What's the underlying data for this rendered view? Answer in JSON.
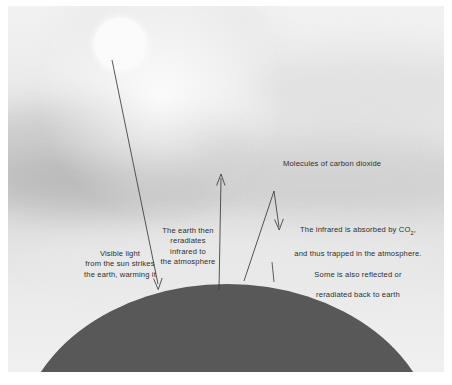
{
  "diagram": {
    "canvas": {
      "width": 452,
      "height": 385
    },
    "colors": {
      "earth": "#585858",
      "sun": "#fbfbfb",
      "sky_top": "#f2f2f2",
      "sky_mid": "#dedede",
      "ink": "#2e2e2e"
    },
    "elements": {
      "sun_name": "sun",
      "earth_name": "earth"
    },
    "labels": {
      "visible_light": "Visible light\nfrom the sun strikes\nthe earth, warming it",
      "reradiates": "The earth then\nreradiates\ninfrared to\nthe atmosphere",
      "absorbed_line1": "The infrared is absorbed by CO",
      "absorbed_sub": "2",
      "absorbed_line1_end": ",",
      "absorbed_line2": "and thus trapped in the atmosphere.",
      "absorbed_line3": "Some is also reflected or",
      "absorbed_line4": "reradiated back to earth",
      "molecules": "Molecules of carbon dioxide"
    },
    "arrows": [
      {
        "name": "incoming-sunlight-arrow",
        "description": "straight line from sun down to earth surface, arrowhead at earth",
        "points": [
          [
            112,
            60
          ],
          [
            158,
            289
          ]
        ],
        "head": "end-down"
      },
      {
        "name": "outgoing-infrared-arrow",
        "description": "vertical line from earth surface up into atmosphere, arrowhead at top",
        "points": [
          [
            219,
            290
          ],
          [
            221,
            174
          ]
        ],
        "head": "end-up"
      },
      {
        "name": "trapped-infrared-zigzag-arrow",
        "description": "line up from earth to a peak, then back down toward earth with arrowhead",
        "points": [
          [
            244,
            281
          ],
          [
            274,
            191
          ],
          [
            279,
            227
          ]
        ],
        "head": "end-down"
      },
      {
        "name": "co2-pointer-line-left",
        "description": "thin leader line from carbon dioxide label area down to earth surface",
        "points": [
          [
            272,
            272
          ],
          [
            274,
            281
          ]
        ]
      }
    ]
  }
}
